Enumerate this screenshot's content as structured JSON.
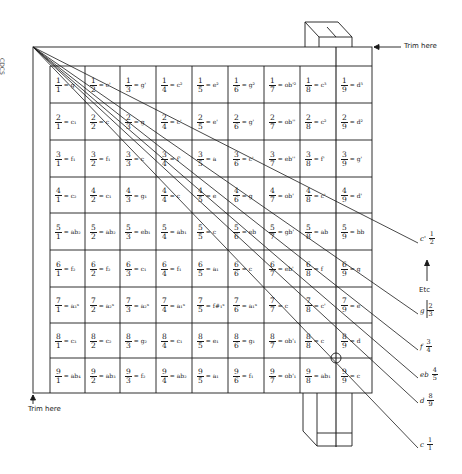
{
  "diagram": {
    "corner_mark": "CDCS",
    "trim_top_label": "Trim here",
    "trim_bottom_label": "Trim here",
    "etc_label": "Etc",
    "colors": {
      "ink": "#1a1a1a",
      "background": "#ffffff"
    },
    "grid": {
      "rows": 9,
      "cols": 9,
      "cells": [
        [
          {
            "n": "1",
            "d": "1",
            "eq": "= g"
          },
          {
            "n": "1",
            "d": "2",
            "eq": "= c'"
          },
          {
            "n": "1",
            "d": "3",
            "eq": "= g'"
          },
          {
            "n": "1",
            "d": "4",
            "eq": "= c²"
          },
          {
            "n": "1",
            "d": "5",
            "eq": "= e²"
          },
          {
            "n": "1",
            "d": "6",
            "eq": "= g²"
          },
          {
            "n": "1",
            "d": "7",
            "eq": "= ob'²"
          },
          {
            "n": "1",
            "d": "8",
            "eq": "= c³"
          },
          {
            "n": "1",
            "d": "9",
            "eq": "= d³"
          }
        ],
        [
          {
            "n": "2",
            "d": "1",
            "eq": "= c₁"
          },
          {
            "n": "2",
            "d": "2",
            "eq": "= c"
          },
          {
            "n": "2",
            "d": "3",
            "eq": "= g"
          },
          {
            "n": "2",
            "d": "4",
            "eq": "= c'"
          },
          {
            "n": "2",
            "d": "5",
            "eq": "= e'"
          },
          {
            "n": "2",
            "d": "6",
            "eq": "= g'"
          },
          {
            "n": "2",
            "d": "7",
            "eq": "= ob''"
          },
          {
            "n": "2",
            "d": "8",
            "eq": "= c²"
          },
          {
            "n": "2",
            "d": "9",
            "eq": "= d²"
          }
        ],
        [
          {
            "n": "3",
            "d": "1",
            "eq": "= f₁"
          },
          {
            "n": "3",
            "d": "2",
            "eq": "= f₁"
          },
          {
            "n": "3",
            "d": "3",
            "eq": "= c"
          },
          {
            "n": "3",
            "d": "4",
            "eq": "= f'"
          },
          {
            "n": "3",
            "d": "5",
            "eq": "= a"
          },
          {
            "n": "3",
            "d": "6",
            "eq": "= c'"
          },
          {
            "n": "3",
            "d": "7",
            "eq": "= eb''"
          },
          {
            "n": "3",
            "d": "8",
            "eq": "= f'"
          },
          {
            "n": "3",
            "d": "9",
            "eq": "= g'"
          }
        ],
        [
          {
            "n": "4",
            "d": "1",
            "eq": "= c₂"
          },
          {
            "n": "4",
            "d": "2",
            "eq": "= c₁"
          },
          {
            "n": "4",
            "d": "3",
            "eq": "= g₁"
          },
          {
            "n": "4",
            "d": "4",
            "eq": "= c"
          },
          {
            "n": "4",
            "d": "5",
            "eq": "= e"
          },
          {
            "n": "4",
            "d": "6",
            "eq": "= g"
          },
          {
            "n": "4",
            "d": "7",
            "eq": "= ob'"
          },
          {
            "n": "4",
            "d": "8",
            "eq": "= c'"
          },
          {
            "n": "4",
            "d": "9",
            "eq": "= d'"
          }
        ],
        [
          {
            "n": "5",
            "d": "1",
            "eq": "= ab₂"
          },
          {
            "n": "5",
            "d": "2",
            "eq": "= ab₂"
          },
          {
            "n": "5",
            "d": "3",
            "eq": "= eb₁"
          },
          {
            "n": "5",
            "d": "4",
            "eq": "= ab₁"
          },
          {
            "n": "5",
            "d": "5",
            "eq": "= c"
          },
          {
            "n": "5",
            "d": "6",
            "eq": "= eb"
          },
          {
            "n": "5",
            "d": "7",
            "eq": "= gb'"
          },
          {
            "n": "5",
            "d": "8",
            "eq": "= ab"
          },
          {
            "n": "5",
            "d": "9",
            "eq": "= bb"
          }
        ],
        [
          {
            "n": "6",
            "d": "1",
            "eq": "= f₂"
          },
          {
            "n": "6",
            "d": "2",
            "eq": "= f₂"
          },
          {
            "n": "6",
            "d": "3",
            "eq": "= c₁"
          },
          {
            "n": "6",
            "d": "4",
            "eq": "= f₁"
          },
          {
            "n": "6",
            "d": "5",
            "eq": "= a₁"
          },
          {
            "n": "6",
            "d": "6",
            "eq": "= c"
          },
          {
            "n": "6",
            "d": "7",
            "eq": "= eb'"
          },
          {
            "n": "6",
            "d": "8",
            "eq": "= f"
          },
          {
            "n": "6",
            "d": "9",
            "eq": "= g"
          }
        ],
        [
          {
            "n": "7",
            "d": "1",
            "eq": "= a₃ˣ"
          },
          {
            "n": "7",
            "d": "2",
            "eq": "= a₂ˣ"
          },
          {
            "n": "7",
            "d": "3",
            "eq": "= a₂ˣ"
          },
          {
            "n": "7",
            "d": "4",
            "eq": "= a₁ˣ"
          },
          {
            "n": "7",
            "d": "5",
            "eq": "= f#₁ˣ"
          },
          {
            "n": "7",
            "d": "6",
            "eq": "= a₁ˣ"
          },
          {
            "n": "7",
            "d": "7",
            "eq": "= c"
          },
          {
            "n": "7",
            "d": "8",
            "eq": "= c'"
          },
          {
            "n": "7",
            "d": "9",
            "eq": "= e"
          }
        ],
        [
          {
            "n": "8",
            "d": "1",
            "eq": "= c₃"
          },
          {
            "n": "8",
            "d": "2",
            "eq": "= c₂"
          },
          {
            "n": "8",
            "d": "3",
            "eq": "= g₂"
          },
          {
            "n": "8",
            "d": "4",
            "eq": "= c₁"
          },
          {
            "n": "8",
            "d": "5",
            "eq": "= e₁"
          },
          {
            "n": "8",
            "d": "6",
            "eq": "= g₁"
          },
          {
            "n": "8",
            "d": "7",
            "eq": "= ob'₁"
          },
          {
            "n": "8",
            "d": "8",
            "eq": "= c"
          },
          {
            "n": "8",
            "d": "9",
            "eq": "= d"
          }
        ],
        [
          {
            "n": "9",
            "d": "1",
            "eq": "= ab₄"
          },
          {
            "n": "9",
            "d": "2",
            "eq": "= ab₃"
          },
          {
            "n": "9",
            "d": "3",
            "eq": "= f₂"
          },
          {
            "n": "9",
            "d": "4",
            "eq": "= ab₂"
          },
          {
            "n": "9",
            "d": "5",
            "eq": "= a₁"
          },
          {
            "n": "9",
            "d": "6",
            "eq": "= f₁"
          },
          {
            "n": "9",
            "d": "7",
            "eq": "= ob'₁"
          },
          {
            "n": "9",
            "d": "8",
            "eq": "= ab₁"
          },
          {
            "n": "9",
            "d": "9",
            "eq": "= c"
          }
        ]
      ]
    },
    "side_labels": [
      {
        "note": "c'",
        "n": "1",
        "d": "2"
      },
      {
        "note": "g",
        "n": "2",
        "d": "3"
      },
      {
        "note": "f",
        "n": "3",
        "d": "4"
      },
      {
        "note": "eb",
        "n": "4",
        "d": "5"
      },
      {
        "note": "d",
        "n": "8",
        "d": "9"
      },
      {
        "note": "c",
        "n": "1",
        "d": "1"
      }
    ]
  }
}
